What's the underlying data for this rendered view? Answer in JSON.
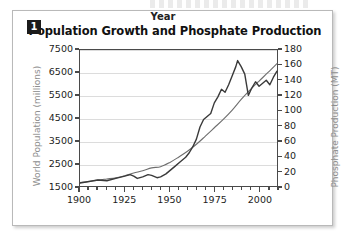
{
  "figure": {
    "number_badge": "1",
    "title": "Population Growth and Phosphate Production"
  },
  "chart_data": {
    "type": "line",
    "title": "Population Growth and Phosphate Production",
    "xlabel": "Year",
    "ylabel": "World Population (millions)",
    "y2label": "Phosphate Production (MT)",
    "grid": true,
    "legend": "none",
    "xlim": [
      1900,
      2010
    ],
    "ylim": [
      1500,
      7500
    ],
    "y2lim": [
      0,
      180
    ],
    "xticks": [
      1900,
      1925,
      1950,
      1975,
      2000
    ],
    "xtick_labels": [
      "1900",
      "1925",
      "1950",
      "1975",
      "2000"
    ],
    "xminor_step": 5,
    "yticks": [
      1500,
      2500,
      3500,
      4500,
      5500,
      6500,
      7500
    ],
    "ytick_labels": [
      "1500",
      "2500",
      "3500",
      "4500",
      "5500",
      "6500",
      "7500"
    ],
    "y2ticks": [
      0,
      20,
      40,
      60,
      80,
      100,
      120,
      140,
      160,
      180
    ],
    "y2tick_labels": [
      "0",
      "20",
      "40",
      "60",
      "80",
      "100",
      "120",
      "140",
      "160",
      "180"
    ],
    "series": [
      {
        "name": "World Population (millions)",
        "axis": "left",
        "color": "#6e6e6e",
        "style": "smooth",
        "x": [
          1900,
          1905,
          1910,
          1915,
          1920,
          1925,
          1930,
          1935,
          1940,
          1945,
          1950,
          1955,
          1960,
          1965,
          1970,
          1975,
          1980,
          1985,
          1990,
          1995,
          2000,
          2005,
          2010
        ],
        "values": [
          1650,
          1700,
          1760,
          1810,
          1860,
          1950,
          2070,
          2170,
          2300,
          2350,
          2530,
          2770,
          3030,
          3340,
          3700,
          4070,
          4440,
          4850,
          5320,
          5740,
          6130,
          6510,
          6900
        ]
      },
      {
        "name": "Phosphate Production (MT)",
        "axis": "right",
        "color": "#3a3a3a",
        "style": "jagged",
        "x": [
          1900,
          1905,
          1910,
          1915,
          1920,
          1925,
          1928,
          1930,
          1932,
          1935,
          1938,
          1940,
          1943,
          1945,
          1948,
          1950,
          1953,
          1956,
          1959,
          1961,
          1963,
          1965,
          1967,
          1969,
          1971,
          1973,
          1975,
          1977,
          1979,
          1981,
          1983,
          1985,
          1987,
          1988,
          1990,
          1992,
          1994,
          1996,
          1998,
          2000,
          2002,
          2004,
          2006,
          2008,
          2010
        ],
        "values": [
          4,
          6,
          8,
          7,
          10,
          13,
          15,
          13,
          10,
          12,
          15,
          14,
          11,
          12,
          16,
          20,
          26,
          32,
          38,
          44,
          52,
          62,
          78,
          88,
          92,
          96,
          110,
          118,
          128,
          124,
          134,
          146,
          158,
          166,
          158,
          148,
          120,
          130,
          138,
          132,
          136,
          140,
          134,
          144,
          152
        ]
      }
    ]
  },
  "axes": {
    "x_title": "Year",
    "y_left_title": "World Population (millions)",
    "y_right_title": "Phosphate Production (MT)"
  }
}
